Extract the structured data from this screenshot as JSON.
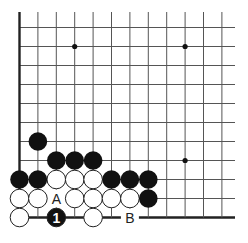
{
  "diagram": {
    "type": "go-board-problem",
    "colors": {
      "line": "#555555",
      "edge": "#222222",
      "black": "#111111",
      "white": "#ffffff",
      "background": "#ffffff"
    },
    "grid": {
      "cols": 12,
      "rows": 11,
      "left_edge": true,
      "bottom_edge": true
    },
    "star_points": [
      {
        "col": 3,
        "row": 1
      },
      {
        "col": 9,
        "row": 1
      },
      {
        "col": 9,
        "row": 7
      }
    ],
    "black_stones": [
      {
        "col": 1,
        "row": 6
      },
      {
        "col": 2,
        "row": 7
      },
      {
        "col": 3,
        "row": 7
      },
      {
        "col": 4,
        "row": 7
      },
      {
        "col": 0,
        "row": 8
      },
      {
        "col": 1,
        "row": 8
      },
      {
        "col": 5,
        "row": 8
      },
      {
        "col": 6,
        "row": 8
      },
      {
        "col": 7,
        "row": 8
      },
      {
        "col": 7,
        "row": 9
      }
    ],
    "white_stones": [
      {
        "col": 2,
        "row": 8
      },
      {
        "col": 3,
        "row": 8
      },
      {
        "col": 4,
        "row": 8
      },
      {
        "col": 0,
        "row": 9
      },
      {
        "col": 1,
        "row": 9
      },
      {
        "col": 3,
        "row": 9
      },
      {
        "col": 4,
        "row": 9
      },
      {
        "col": 5,
        "row": 9
      },
      {
        "col": 6,
        "row": 9
      },
      {
        "col": 0,
        "row": 10
      },
      {
        "col": 4,
        "row": 10
      }
    ],
    "numbered_stones": [
      {
        "col": 2,
        "row": 10,
        "color": "black",
        "label": "1"
      }
    ],
    "point_labels": [
      {
        "col": 2,
        "row": 9,
        "label": "A"
      },
      {
        "col": 6,
        "row": 10,
        "label": "B"
      }
    ]
  }
}
